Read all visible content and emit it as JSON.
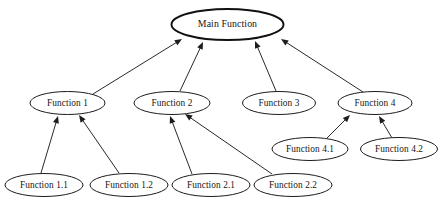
{
  "diagram": {
    "background_color": "#ffffff",
    "node_fill": "#ffffff",
    "node_stroke": "#1c1c1c",
    "edge_color": "#1d1d1d",
    "nodes": [
      {
        "id": "main",
        "label": "Main Function",
        "cx": 227.5,
        "cy": 24.5,
        "rx": 56,
        "ry": 15.5,
        "emphasis": "thick"
      },
      {
        "id": "f1",
        "label": "Function 1",
        "cx": 67.5,
        "cy": 103,
        "rx": 37.5,
        "ry": 11.5,
        "emphasis": "normal"
      },
      {
        "id": "f2",
        "label": "Function 2",
        "cx": 172,
        "cy": 103,
        "rx": 38,
        "ry": 11.5,
        "emphasis": "normal"
      },
      {
        "id": "f3",
        "label": "Function 3",
        "cx": 279,
        "cy": 103,
        "rx": 36.5,
        "ry": 11.5,
        "emphasis": "normal"
      },
      {
        "id": "f4",
        "label": "Function 4",
        "cx": 375,
        "cy": 103,
        "rx": 37,
        "ry": 11.5,
        "emphasis": "normal"
      },
      {
        "id": "f41",
        "label": "Function 4.1",
        "cx": 310,
        "cy": 149,
        "rx": 38,
        "ry": 11.5,
        "emphasis": "normal"
      },
      {
        "id": "f42",
        "label": "Function 4.2",
        "cx": 399,
        "cy": 149,
        "rx": 38.5,
        "ry": 11.5,
        "emphasis": "normal"
      },
      {
        "id": "f11",
        "label": "Function 1.1",
        "cx": 44,
        "cy": 185,
        "rx": 39,
        "ry": 11.5,
        "emphasis": "normal"
      },
      {
        "id": "f12",
        "label": "Function 1.2",
        "cx": 129,
        "cy": 185,
        "rx": 39,
        "ry": 11.5,
        "emphasis": "normal"
      },
      {
        "id": "f21",
        "label": "Function 2.1",
        "cx": 211,
        "cy": 185,
        "rx": 39,
        "ry": 11.5,
        "emphasis": "normal"
      },
      {
        "id": "f22",
        "label": "Function 2.2",
        "cx": 293,
        "cy": 185,
        "rx": 39,
        "ry": 11.5,
        "emphasis": "normal"
      }
    ],
    "edges": [
      {
        "id": "e-f1-main",
        "from": "f1",
        "to": "main",
        "x1": 93,
        "y1": 94,
        "x2": 182,
        "y2": 39
      },
      {
        "id": "e-f2-main",
        "from": "f2",
        "to": "main",
        "x1": 180,
        "y1": 91,
        "x2": 203,
        "y2": 42
      },
      {
        "id": "e-f3-main",
        "from": "f3",
        "to": "main",
        "x1": 276,
        "y1": 91,
        "x2": 255,
        "y2": 41
      },
      {
        "id": "e-f4-main",
        "from": "f4",
        "to": "main",
        "x1": 363,
        "y1": 92,
        "x2": 281,
        "y2": 39
      },
      {
        "id": "e-f11-f1",
        "from": "f11",
        "to": "f1",
        "x1": 41,
        "y1": 173,
        "x2": 58,
        "y2": 116
      },
      {
        "id": "e-f12-f1",
        "from": "f12",
        "to": "f1",
        "x1": 119,
        "y1": 173,
        "x2": 79,
        "y2": 115
      },
      {
        "id": "e-f21-f2",
        "from": "f21",
        "to": "f2",
        "x1": 192,
        "y1": 174,
        "x2": 170,
        "y2": 116
      },
      {
        "id": "e-f22-f2",
        "from": "f22",
        "to": "f2",
        "x1": 272,
        "y1": 174,
        "x2": 185,
        "y2": 114
      },
      {
        "id": "e-f41-f4",
        "from": "f41",
        "to": "f4",
        "x1": 327,
        "y1": 138,
        "x2": 350,
        "y2": 115
      },
      {
        "id": "e-f42-f4",
        "from": "f42",
        "to": "f4",
        "x1": 392,
        "y1": 138,
        "x2": 379,
        "y2": 116
      }
    ]
  }
}
